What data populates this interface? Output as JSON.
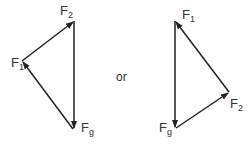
{
  "diagram": {
    "connector_text": "or",
    "left_triangle": {
      "labels": {
        "f2": {
          "base": "F",
          "sub": "2"
        },
        "f1": {
          "base": "F",
          "sub": "1"
        },
        "fg": {
          "base": "F",
          "sub": "g"
        }
      }
    },
    "right_triangle": {
      "labels": {
        "f1": {
          "base": "F",
          "sub": "1"
        },
        "f2": {
          "base": "F",
          "sub": "2"
        },
        "fg": {
          "base": "F",
          "sub": "g"
        }
      }
    },
    "colors": {
      "arrow": "#222222",
      "text": "#333333"
    }
  }
}
